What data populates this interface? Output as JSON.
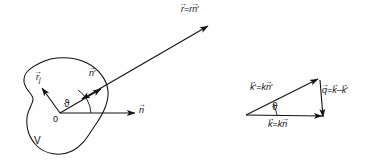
{
  "figure": {
    "background_color": "#fefefe",
    "stroke_color": "#121212",
    "width": 374,
    "height": 164
  },
  "left_panel": {
    "name": "scattering-volume-panel",
    "volume_label": "V",
    "origin_label": "0",
    "angle_label": "ϑ",
    "vectors": {
      "r_j": {
        "base": "r",
        "subscript": "j",
        "arrow": true,
        "label": "r⃗_j"
      },
      "n_prime": {
        "base": "n",
        "prime": true,
        "arrow": true,
        "label": "n⃗′"
      },
      "n": {
        "base": "n",
        "prime": false,
        "arrow": true,
        "label": "n⃗"
      },
      "r_vector": {
        "label": "r⃗ = r n⃗′",
        "lhs": "r",
        "rhs_scalar": "r",
        "rhs_unit": "n′"
      }
    }
  },
  "right_panel": {
    "name": "momentum-transfer-triangle",
    "angle_label": "ϑ",
    "edges": {
      "k_prime": {
        "label": "k⃗′ = k n⃗′",
        "lhs": "k′",
        "rhs_scalar": "k",
        "rhs_unit": "n′"
      },
      "k": {
        "label": "k⃗ = k n⃗",
        "lhs": "k",
        "rhs_scalar": "k",
        "rhs_unit": "n"
      },
      "q": {
        "label": "q⃗ = k⃗ − k⃗′",
        "lhs": "q",
        "rhs": "k − k′"
      }
    }
  },
  "glyphs": {
    "vector_arrow": "→",
    "prime": "′",
    "minus": "−",
    "equals": "=",
    "theta_variant": "ϑ"
  }
}
